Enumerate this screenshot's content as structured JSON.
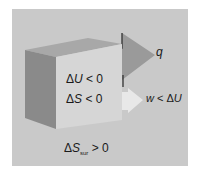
{
  "diagram": {
    "system_labels": {
      "delta_u": {
        "symbol": "Δ",
        "var": "U",
        "relation": "< 0"
      },
      "delta_s": {
        "symbol": "Δ",
        "var": "S",
        "relation": "< 0"
      }
    },
    "surroundings_label": {
      "symbol": "Δ",
      "var": "S",
      "subscript": "sur",
      "relation": "> 0"
    },
    "heat_arrow": {
      "label": "q"
    },
    "work_arrow": {
      "label_var": "w",
      "label_rel": " < Δ",
      "label_var2": "U"
    },
    "colors": {
      "background": "#c9c9c9",
      "cube_front": "#d6d6d6",
      "cube_side": "#8a8a8a",
      "cube_top": "#a8a8a8",
      "heat_arrow": "#9a9a9a",
      "work_arrow": "#e4e4e4"
    }
  }
}
